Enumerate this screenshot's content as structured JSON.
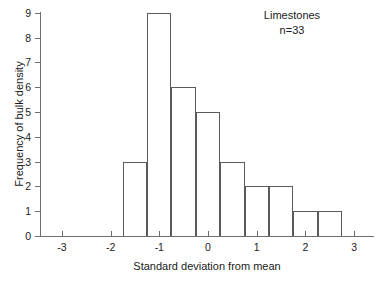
{
  "chart_data": {
    "type": "bar",
    "title": "",
    "subtitle": "",
    "xlabel": "Standard deviation from mean",
    "ylabel": "Frequency of bulk density",
    "xlim": [
      -3.5,
      3.5
    ],
    "ylim": [
      0,
      9
    ],
    "grid": false,
    "legend": null,
    "bin_width": 0.5,
    "categories": [
      "-1.75 to -1.25",
      "-1.25 to -0.75",
      "-0.75 to -0.25",
      "-0.25 to 0.25",
      "0.25 to 0.75",
      "0.75 to 1.25",
      "1.25 to 1.75",
      "1.75 to 2.25",
      "2.25 to 2.75"
    ],
    "bins": [
      {
        "left": -1.75,
        "right": -1.25,
        "value": 3
      },
      {
        "left": -1.25,
        "right": -0.75,
        "value": 9
      },
      {
        "left": -0.75,
        "right": -0.25,
        "value": 6
      },
      {
        "left": -0.25,
        "right": 0.25,
        "value": 5
      },
      {
        "left": 0.25,
        "right": 0.75,
        "value": 3
      },
      {
        "left": 0.75,
        "right": 1.25,
        "value": 2
      },
      {
        "left": 1.25,
        "right": 1.75,
        "value": 2
      },
      {
        "left": 1.75,
        "right": 2.25,
        "value": 1
      },
      {
        "left": 2.25,
        "right": 2.75,
        "value": 1
      }
    ],
    "values": [
      3,
      9,
      6,
      5,
      3,
      2,
      2,
      1,
      1
    ],
    "xticks": [
      -3,
      -2,
      -1,
      0,
      1,
      2,
      3
    ],
    "xtick_labels": [
      "-3",
      "-2",
      "-1",
      "0",
      "1",
      "2",
      "3"
    ],
    "yticks": [
      0,
      1,
      2,
      3,
      4,
      5,
      6,
      7,
      8,
      9
    ],
    "ytick_labels": [
      "0",
      "1",
      "2",
      "3",
      "4",
      "5",
      "6",
      "7",
      "8",
      "9"
    ],
    "annotations": [
      {
        "text": "Limestones"
      },
      {
        "text": "n=33"
      }
    ]
  },
  "colors": {
    "bar_stroke": "#5a5a5a",
    "axis": "#6e6e6e",
    "text": "#1a1a1a",
    "background": "#ffffff"
  }
}
